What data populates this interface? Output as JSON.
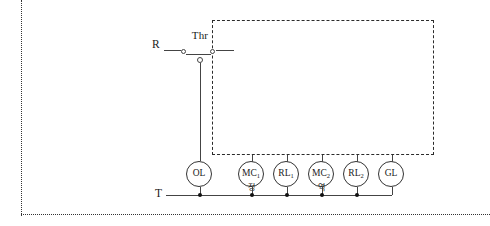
{
  "diagram": {
    "terminals": [
      {
        "name": "R",
        "label": "R",
        "x": 152,
        "y": 44
      },
      {
        "name": "T",
        "label": "T",
        "x": 155,
        "y": 183
      }
    ],
    "contact": {
      "label": "Thr",
      "type": "normally-closed-contact",
      "symbol": "thermal-overload-relay"
    },
    "open_terminal": {
      "type": "open-terminal-node"
    },
    "nodes": [
      {
        "name": "OL",
        "base": "OL",
        "sub": "",
        "x": 186,
        "sub_label": ""
      },
      {
        "name": "MC1",
        "base": "MC",
        "sub": "1",
        "x": 238,
        "sub_label": "정"
      },
      {
        "name": "RL1",
        "base": "RL",
        "sub": "1",
        "x": 273,
        "sub_label": ""
      },
      {
        "name": "MC2",
        "base": "MC",
        "sub": "2",
        "x": 308,
        "sub_label": "역"
      },
      {
        "name": "RL2",
        "base": "RL",
        "sub": "2",
        "x": 343,
        "sub_label": ""
      },
      {
        "name": "GL",
        "base": "GL",
        "sub": "",
        "x": 378,
        "sub_label": ""
      }
    ],
    "bus": {
      "name": "T-bus",
      "junction_count": 5
    },
    "enclosure": {
      "name": "dashed-enclosure",
      "style": "dashed"
    },
    "colors": {
      "wire": "#444444",
      "outline": "#333333",
      "background": "#ffffff",
      "dashed_border": "#2b2b2b"
    }
  }
}
